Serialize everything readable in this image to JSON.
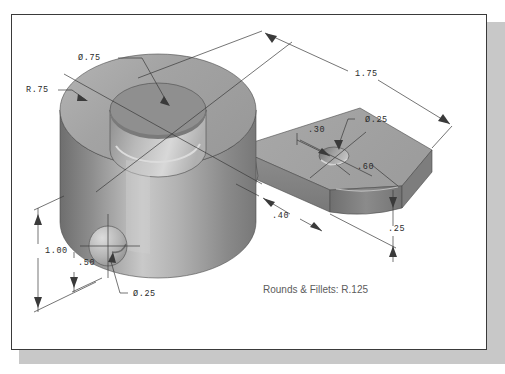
{
  "sheet": {
    "background_color": "#ffffff",
    "border_color": "#3a3a3a",
    "shadow_color": "#c8c8c8"
  },
  "drawing": {
    "title": "Isometric shaded CAD part — cylindrical boss with rectangular arm",
    "note": "Rounds & Fillets: R.125",
    "colors": {
      "top_face": "#a8a8a8",
      "front_face": "#9a9a9a",
      "side_face": "#878787",
      "highlight": "#d2d2d2",
      "shadow": "#6f6f6f",
      "line": "#3a3a3a",
      "text": "#2b2b2b",
      "note_text": "#5c5c5c"
    },
    "dimensions": [
      {
        "id": "dia-top-hole",
        "label": "Ø.75",
        "x": 78,
        "y": 60,
        "kind": "leader-callout"
      },
      {
        "id": "radius-boss",
        "label": "R.75",
        "x": 26,
        "y": 92,
        "kind": "leader-callout"
      },
      {
        "id": "overall-length",
        "label": "1.75",
        "x": 355,
        "y": 76,
        "kind": "linear"
      },
      {
        "id": "dia-arm-hole",
        "label": "Ø.25",
        "x": 365,
        "y": 122,
        "kind": "leader-callout"
      },
      {
        "id": "arm-hole-offset",
        "label": ".30",
        "x": 308,
        "y": 132,
        "kind": "linear"
      },
      {
        "id": "arm-width",
        "label": ".60",
        "x": 357,
        "y": 169,
        "kind": "linear"
      },
      {
        "id": "arm-end-offset",
        "label": ".40",
        "x": 272,
        "y": 218,
        "kind": "linear"
      },
      {
        "id": "arm-thickness",
        "label": ".25",
        "x": 388,
        "y": 231,
        "kind": "linear"
      },
      {
        "id": "boss-height",
        "label": "1.00",
        "x": 45,
        "y": 253,
        "kind": "linear"
      },
      {
        "id": "side-hole-height",
        "label": ".50",
        "x": 78,
        "y": 265,
        "kind": "linear"
      },
      {
        "id": "dia-side-hole",
        "label": "Ø.25",
        "x": 133,
        "y": 296,
        "kind": "leader-callout"
      }
    ]
  }
}
